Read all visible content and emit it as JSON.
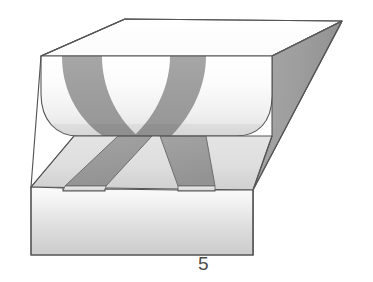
{
  "figure": {
    "caption": "5",
    "type": "technical-line-drawing",
    "colors": {
      "outline": "#4d4d4d",
      "strip_dark": "#9a9a9a",
      "strip_dark_edge": "#6e6e6e",
      "top_face_light": "#e8e8e8",
      "top_face_dark": "#d2d2d2",
      "front_face_light": "#f6f6f6",
      "front_face_dark": "#c9c9c9",
      "right_face": "#a2a2a2",
      "right_face_dark": "#8e8e8e",
      "groove_light": "#fbfbfb",
      "groove_mid": "#ededed",
      "groove_shadow": "#dcdcdc",
      "back_top_face": "#fdfdfd",
      "background": "#ffffff"
    },
    "geometry": {
      "block_front_top_left": [
        31,
        187
      ],
      "block_front_bottom_left": [
        31,
        255
      ],
      "block_front_bottom_right": [
        253,
        255
      ],
      "block_front_top_right": [
        253,
        190
      ],
      "block_back_top_right": [
        342,
        21
      ],
      "top_face_back_left": [
        125,
        19
      ],
      "groove_left_end": [
        41,
        55
      ],
      "groove_right_end": [
        272,
        55
      ],
      "strip_count": 2
    },
    "labels": {
      "figure_number": "5"
    }
  }
}
